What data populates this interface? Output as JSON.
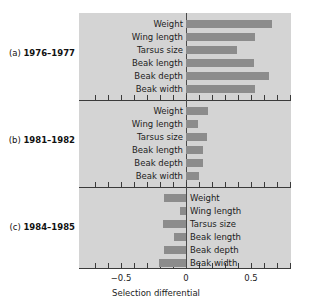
{
  "chart_data": {
    "type": "bar",
    "title": "",
    "xlabel": "Selection differential",
    "ylabel": "",
    "xlim": [
      -0.7,
      0.8
    ],
    "xticks": [
      -0.7,
      -0.6,
      -0.5,
      -0.4,
      -0.3,
      -0.2,
      -0.1,
      0,
      0.1,
      0.2,
      0.3,
      0.4,
      0.5,
      0.6,
      0.7,
      0.8
    ],
    "xtick_labels": [
      {
        "value": -0.5,
        "text": "−0.5"
      },
      {
        "value": 0,
        "text": "0"
      },
      {
        "value": 0.5,
        "text": "0.5"
      }
    ],
    "grid": false,
    "legend": "none",
    "orientation": "horizontal",
    "bar_color": "#8c8c8c",
    "panel_background": "#d4d4d4",
    "categories": [
      "Weight",
      "Wing length",
      "Tarsus size",
      "Beak length",
      "Beak depth",
      "Beak width"
    ],
    "panels": [
      {
        "id": "a",
        "index_label": "(a)",
        "period": "1976–1977",
        "label": "(a) 1976–1977",
        "label_side": "right",
        "values": [
          0.66,
          0.53,
          0.39,
          0.52,
          0.64,
          0.53
        ]
      },
      {
        "id": "b",
        "index_label": "(b)",
        "period": "1981–1982",
        "label": "(b) 1981–1982",
        "label_side": "right",
        "values": [
          0.17,
          0.09,
          0.16,
          0.13,
          0.13,
          0.1
        ]
      },
      {
        "id": "c",
        "index_label": "(c)",
        "period": "1984–1985",
        "label": "(c) 1984–1985",
        "label_side": "left",
        "values": [
          -0.17,
          -0.05,
          -0.18,
          -0.09,
          -0.17,
          -0.21
        ]
      }
    ]
  }
}
